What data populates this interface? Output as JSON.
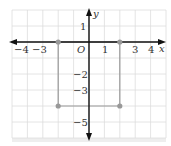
{
  "figure": {
    "type": "coordinate-plane",
    "axes": {
      "x_label": "x",
      "y_label": "y",
      "origin_label": "O",
      "x_range": [
        -5,
        5
      ],
      "y_range": [
        -6,
        2
      ],
      "x_tick_labels": [
        "−4",
        "−3",
        "1",
        "3",
        "4"
      ],
      "x_tick_values": [
        -4,
        -3,
        1,
        3,
        4
      ],
      "y_tick_labels": [
        "1",
        "−2",
        "−3",
        "−5"
      ],
      "y_tick_values": [
        1,
        -2,
        -3,
        -5
      ]
    },
    "points": [
      {
        "x": -2,
        "y": 0
      },
      {
        "x": 2,
        "y": 0
      },
      {
        "x": -2,
        "y": -4
      },
      {
        "x": 2,
        "y": -4
      }
    ],
    "rectangle": {
      "vertices": [
        [
          -2,
          0
        ],
        [
          2,
          0
        ],
        [
          2,
          -4
        ],
        [
          -2,
          -4
        ]
      ]
    },
    "colors": {
      "grid": "#dddddd",
      "axis": "#111111",
      "shape": "#999999",
      "point": "#999999",
      "shadow": "#e6e6e6"
    }
  },
  "chart_data": {
    "type": "scatter",
    "title": "",
    "xlabel": "x",
    "ylabel": "y",
    "x": [
      -2,
      2,
      -2,
      2
    ],
    "y": [
      0,
      0,
      -4,
      -4
    ],
    "xlim": [
      -5,
      5
    ],
    "ylim": [
      -6,
      2
    ],
    "grid": true,
    "annotations": [
      "O"
    ],
    "x_tick_labels": [
      "-4",
      "-3",
      "1",
      "3",
      "4"
    ],
    "y_tick_labels": [
      "1",
      "-2",
      "-3",
      "-5"
    ],
    "shape": "rectangle with vertices (-2,0), (2,0), (2,-4), (-2,-4)"
  }
}
